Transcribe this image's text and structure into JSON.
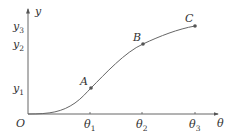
{
  "diagram": {
    "type": "function-curve",
    "axes": {
      "x_label": "θ",
      "y_label": "y",
      "origin_label": "O"
    },
    "x_ticks": [
      {
        "base": "θ",
        "sub": "1"
      },
      {
        "base": "θ",
        "sub": "2"
      },
      {
        "base": "θ",
        "sub": "3"
      }
    ],
    "y_ticks": [
      {
        "base": "y",
        "sub": "1"
      },
      {
        "base": "y",
        "sub": "2"
      },
      {
        "base": "y",
        "sub": "3"
      }
    ],
    "points": [
      {
        "label": "A",
        "x": "θ1",
        "y": "y1"
      },
      {
        "label": "B",
        "x": "θ2",
        "y": "y2"
      },
      {
        "label": "C",
        "x": "θ3",
        "y": "y3"
      }
    ],
    "colors": {
      "axis": "#555555",
      "curve": "#666666",
      "point": "#555555",
      "text": "#333333"
    }
  }
}
